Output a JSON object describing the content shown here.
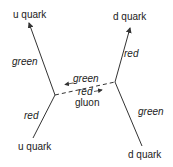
{
  "diagram": {
    "type": "feynman-diagram",
    "particles": {
      "incoming_left": "u quark",
      "outgoing_left": "u quark",
      "incoming_right": "d quark",
      "outgoing_right": "d quark",
      "exchange": "gluon"
    },
    "color_labels": {
      "left_upper": "green",
      "left_lower": "red",
      "right_upper": "red",
      "right_lower": "green",
      "gluon_top": "green",
      "gluon_bottom": "red"
    },
    "gluon_label": "gluon",
    "line_color": "#333333",
    "background": "#ffffff"
  }
}
